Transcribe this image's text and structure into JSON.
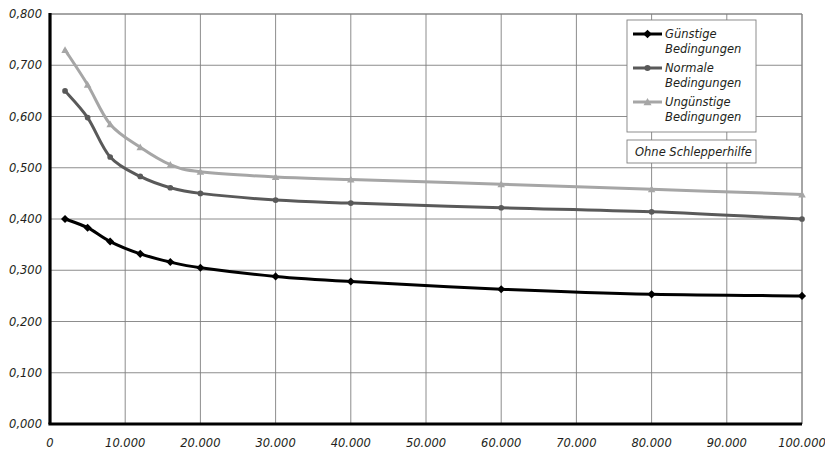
{
  "chart_data": {
    "type": "line",
    "title": "",
    "subtitle": "",
    "xlabel": "",
    "ylabel": "",
    "xlim": [
      0,
      100000
    ],
    "ylim": [
      0.0,
      0.8
    ],
    "grid": true,
    "legend_position": "top-right",
    "x_tick_labels": [
      "0",
      "10.000",
      "20.000",
      "30.000",
      "40.000",
      "50.000",
      "60.000",
      "70.000",
      "80.000",
      "90.000",
      "100.000"
    ],
    "x_tick_values": [
      0,
      10000,
      20000,
      30000,
      40000,
      50000,
      60000,
      70000,
      80000,
      90000,
      100000
    ],
    "y_tick_labels": [
      "0,000",
      "0,100",
      "0,200",
      "0,300",
      "0,400",
      "0,500",
      "0,600",
      "0,700",
      "0,800"
    ],
    "y_tick_values": [
      0.0,
      0.1,
      0.2,
      0.3,
      0.4,
      0.5,
      0.6,
      0.7,
      0.8
    ],
    "annotations": [
      "Ohne Schlepperhilfe"
    ],
    "series": [
      {
        "name": "Günstige Bedingungen",
        "name_line1": "Günstige",
        "name_line2": "Bedingungen",
        "color": "#000000",
        "marker": "diamond",
        "x": [
          2000,
          5000,
          8000,
          12000,
          16000,
          20000,
          30000,
          40000,
          60000,
          80000,
          100000
        ],
        "values": [
          0.4,
          0.383,
          0.356,
          0.332,
          0.316,
          0.305,
          0.288,
          0.278,
          0.263,
          0.253,
          0.25
        ]
      },
      {
        "name": "Normale Bedingungen",
        "name_line1": "Normale",
        "name_line2": "Bedingungen",
        "color": "#595959",
        "marker": "circle",
        "x": [
          2000,
          5000,
          8000,
          12000,
          16000,
          20000,
          30000,
          40000,
          60000,
          80000,
          100000
        ],
        "values": [
          0.65,
          0.598,
          0.521,
          0.483,
          0.461,
          0.45,
          0.437,
          0.431,
          0.422,
          0.414,
          0.4
        ]
      },
      {
        "name": "Ungünstige Bedingungen",
        "name_line1": "Ungünstige",
        "name_line2": "Bedingungen",
        "color": "#a6a6a6",
        "marker": "triangle",
        "x": [
          2000,
          5000,
          8000,
          12000,
          16000,
          20000,
          30000,
          40000,
          60000,
          80000,
          100000
        ],
        "values": [
          0.73,
          0.662,
          0.585,
          0.54,
          0.506,
          0.492,
          0.482,
          0.477,
          0.468,
          0.458,
          0.448
        ]
      }
    ]
  },
  "legend": {
    "items": [
      {
        "label_line1": "Günstige",
        "label_line2": "Bedingungen",
        "color": "#000000",
        "marker": "diamond"
      },
      {
        "label_line1": "Normale",
        "label_line2": "Bedingungen",
        "color": "#595959",
        "marker": "circle"
      },
      {
        "label_line1": "Ungünstige",
        "label_line2": "Bedingungen",
        "color": "#a6a6a6",
        "marker": "triangle"
      }
    ]
  },
  "note_box": {
    "text": "Ohne Schlepperhilfe"
  },
  "axis_style": {
    "axis_color": "#000000",
    "grid_color": "#808080",
    "plot_background": "#ffffff"
  }
}
